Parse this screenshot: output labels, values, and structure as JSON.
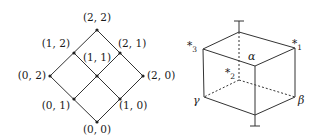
{
  "lattice": {
    "nodes": [
      {
        "id": "22",
        "label": "(2, 2)",
        "x": 97,
        "y": 30,
        "lx": 97,
        "ly": 21,
        "anchor": "middle"
      },
      {
        "id": "12",
        "label": "(1, 2)",
        "x": 74,
        "y": 53,
        "lx": 70,
        "ly": 47,
        "anchor": "end"
      },
      {
        "id": "21",
        "label": "(2, 1)",
        "x": 120,
        "y": 53,
        "lx": 118,
        "ly": 47,
        "anchor": "start"
      },
      {
        "id": "11",
        "label": "(1, 1)",
        "x": 97,
        "y": 76,
        "lx": 97,
        "ly": 61,
        "anchor": "middle"
      },
      {
        "id": "02",
        "label": "(0, 2)",
        "x": 50,
        "y": 76,
        "lx": 46,
        "ly": 79,
        "anchor": "end"
      },
      {
        "id": "20",
        "label": "(2, 0)",
        "x": 143,
        "y": 76,
        "lx": 147,
        "ly": 79,
        "anchor": "start"
      },
      {
        "id": "01",
        "label": "(0, 1)",
        "x": 74,
        "y": 99,
        "lx": 70,
        "ly": 109,
        "anchor": "end"
      },
      {
        "id": "10",
        "label": "(1, 0)",
        "x": 120,
        "y": 99,
        "lx": 119,
        "ly": 109,
        "anchor": "start"
      },
      {
        "id": "00",
        "label": "(0, 0)",
        "x": 97,
        "y": 122,
        "lx": 97,
        "ly": 133,
        "anchor": "middle"
      }
    ]
  },
  "cube": {
    "top_label": "⊤",
    "bottom_label": "⊥",
    "alpha": "α",
    "beta": "β",
    "gamma": "γ",
    "star": "*",
    "star1_sub": "1",
    "star2_sub": "2",
    "star3_sub": "3"
  }
}
